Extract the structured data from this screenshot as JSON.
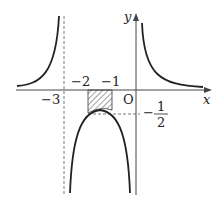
{
  "diagram": {
    "axes": {
      "x_label": "x",
      "y_label": "y",
      "origin_label": "O"
    },
    "ticks": {
      "x_neg3": "−3",
      "x_neg2": "−2",
      "x_neg1": "−1"
    },
    "y_value": {
      "sign": "−",
      "numerator": "1",
      "denominator": "2"
    },
    "asymptotes": [
      "x = -3",
      "x = 0"
    ],
    "shaded_region": {
      "x_from": -2,
      "x_to": -1
    }
  }
}
